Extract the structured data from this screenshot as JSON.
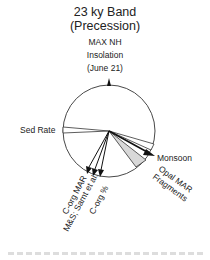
{
  "title": {
    "line1": "23 ky Band",
    "line2": "(Precession)",
    "line3": "MAX NH",
    "line4": "Insolation",
    "line5": "(June 21)"
  },
  "wheel": {
    "center": [
      109,
      131
    ],
    "radius": 46,
    "reference_marker": "MAX NH Insolation (June 21) at top",
    "colors": {
      "stroke": "#333333",
      "fill": "#ffffff",
      "shaded_wedge": "#d8d8d8",
      "arrow": "#111111"
    }
  },
  "phase_vectors": [
    {
      "label": "Sed Rate",
      "type": "open-wedge",
      "angle_deg_clockwise_from_top": 272
    },
    {
      "label": "C-org MAR",
      "type": "arrow",
      "angle_deg_clockwise_from_top": 208
    },
    {
      "label": "M&S; Sarnt et al.",
      "type": "arrow",
      "angle_deg_clockwise_from_top": 203
    },
    {
      "label": "C-org %",
      "type": "arrow",
      "angle_deg_clockwise_from_top": 198
    },
    {
      "label": "Monsoon",
      "type": "open-wedge",
      "angle_deg_clockwise_from_top": 118
    },
    {
      "label": "Opal MAR",
      "type": "arrow",
      "angle_deg_clockwise_from_top": 123
    },
    {
      "label": "Fragments",
      "type": "shaded-wedge",
      "angle_deg_clockwise_from_top": 140
    }
  ],
  "labels": {
    "sed_rate": "Sed Rate",
    "monsoon": "Monsoon",
    "opal_mar": "Opal MAR",
    "fragments": "Fragments",
    "corg_mar": "C-org MAR",
    "ms_sarnt": "M&S; Sarnt et al.",
    "corg_pct": "C-org %"
  }
}
